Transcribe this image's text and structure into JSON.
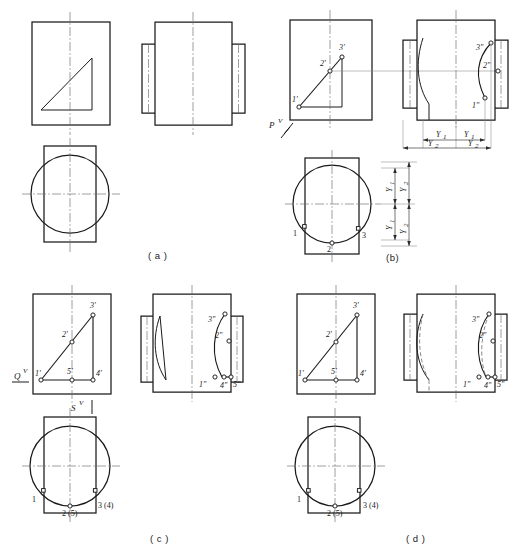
{
  "figure": {
    "type": "engineering-drawing",
    "panel_count": 4,
    "line_colors": {
      "object": "#1a1a1a",
      "hidden": "#6d6d6d",
      "centerline": "#6b6b6b",
      "projection": "#8a8a8a",
      "background": "#ffffff"
    }
  },
  "captions": {
    "a": "( a )",
    "b": "(b)",
    "c": "( c )",
    "d": "( d )"
  },
  "panels": {
    "a": {
      "caption": "( a )",
      "views": [
        "front-view",
        "right-side-view",
        "top-view"
      ],
      "front_feature": "right-triangle",
      "top_feature": "circle-with-slot",
      "labels": []
    },
    "b": {
      "caption": "(b)",
      "views": [
        "front-view",
        "right-side-view",
        "top-view"
      ],
      "cutting_plane_label": "P",
      "cutting_plane_sup": "V",
      "front_labels": [
        "1'",
        "2'",
        "3'"
      ],
      "side_labels": [
        "1\"",
        "2\"",
        "3\""
      ],
      "top_labels": [
        "1",
        "2",
        "3"
      ],
      "dimensions": [
        "Y1",
        "Y2"
      ],
      "dim_sub": [
        "1",
        "2"
      ],
      "dim_base": "Y"
    },
    "c": {
      "caption": "( c )",
      "views": [
        "front-view",
        "right-side-view",
        "top-view"
      ],
      "plane_q_label": "Q",
      "plane_q_sup": "V",
      "plane_s_label": "S",
      "plane_s_sup": "V",
      "front_labels": [
        "1'",
        "2'",
        "3'",
        "4'",
        "5'"
      ],
      "side_labels": [
        "1\"",
        "2\"",
        "3\"",
        "4\"",
        "5\""
      ],
      "top_labels": [
        "1",
        "2 (5)",
        "3 (4)"
      ]
    },
    "d": {
      "caption": "( d )",
      "views": [
        "front-view",
        "right-side-view",
        "top-view"
      ],
      "front_labels": [
        "1'",
        "2'",
        "3'",
        "4'",
        "5'"
      ],
      "side_labels": [
        "1\"",
        "2\"",
        "3\"",
        "4\"",
        "5\""
      ],
      "top_labels": [
        "1",
        "2 (5)",
        "3 (4)"
      ],
      "has_hidden_lines": true
    }
  },
  "labels": {
    "p1": "1",
    "p2": "2",
    "p3": "3",
    "p4": "4",
    "p5": "5",
    "p1p": "1'",
    "p2p": "2'",
    "p3p": "3'",
    "p4p": "4'",
    "p5p": "5'",
    "p1pp": "1\"",
    "p2pp": "2\"",
    "p3pp": "3\"",
    "p4pp": "4\"",
    "p5pp": "5\"",
    "g25": "2 (5)",
    "g34": "3 (4)",
    "P": "P",
    "Q": "Q",
    "S": "S",
    "V": "V",
    "Y": "Y",
    "sub1": "1",
    "sub2": "2"
  }
}
